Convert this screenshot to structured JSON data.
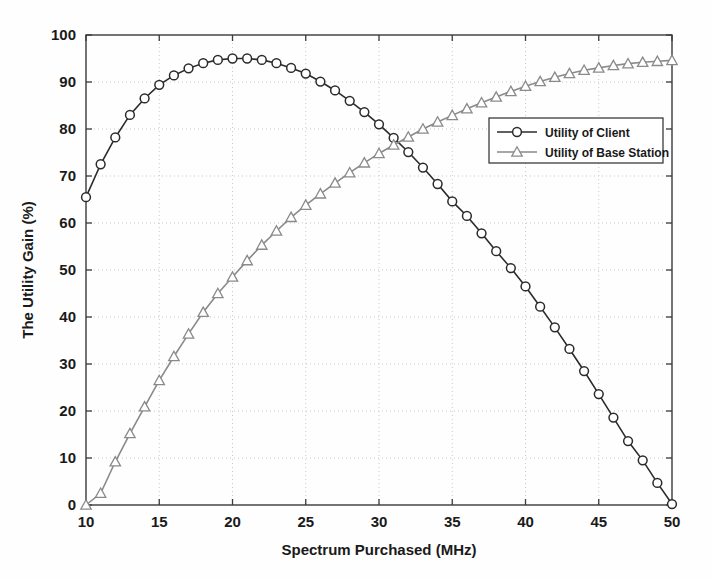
{
  "chart_data": {
    "type": "line",
    "title": "",
    "xlabel": "Spectrum Purchased (MHz)",
    "ylabel": "The Utility Gain (%)",
    "xlim": [
      10,
      50
    ],
    "ylim": [
      0,
      100
    ],
    "xticks": [
      10,
      15,
      20,
      25,
      30,
      35,
      40,
      45,
      50
    ],
    "yticks": [
      0,
      10,
      20,
      30,
      40,
      50,
      60,
      70,
      80,
      90,
      100
    ],
    "xtick_labels": [
      "10",
      "15",
      "20",
      "25",
      "30",
      "35",
      "40",
      "45",
      "50"
    ],
    "ytick_labels": [
      "0",
      "10",
      "20",
      "30",
      "40",
      "50",
      "60",
      "70",
      "80",
      "90",
      "100"
    ],
    "grid": true,
    "grid_style": "dotted",
    "legend_position": "center-right",
    "x": [
      10,
      11,
      12,
      13,
      14,
      15,
      16,
      17,
      18,
      19,
      20,
      21,
      22,
      23,
      24,
      25,
      26,
      27,
      28,
      29,
      30,
      31,
      32,
      33,
      34,
      35,
      36,
      37,
      38,
      39,
      40,
      41,
      42,
      43,
      44,
      45,
      46,
      47,
      48,
      49,
      50
    ],
    "series": [
      {
        "name": "Utility of Client",
        "marker": "circle",
        "color": "#2b2b2b",
        "values": [
          65.5,
          72.5,
          78.2,
          83.0,
          86.5,
          89.4,
          91.4,
          92.9,
          94.0,
          94.7,
          95.0,
          95.0,
          94.7,
          94.0,
          93.0,
          91.8,
          90.1,
          88.2,
          86.0,
          83.6,
          81.0,
          78.1,
          75.1,
          71.8,
          68.3,
          64.6,
          61.5,
          57.8,
          54.0,
          50.4,
          46.5,
          42.2,
          37.8,
          33.2,
          28.5,
          23.6,
          18.6,
          13.6,
          9.5,
          4.7,
          0.2
        ]
      },
      {
        "name": "Utility of Base Station",
        "marker": "triangle",
        "color": "#8a8a8a",
        "values": [
          0.0,
          2.5,
          9.2,
          15.2,
          20.9,
          26.5,
          31.6,
          36.4,
          41.0,
          45.0,
          48.5,
          52.0,
          55.3,
          58.3,
          61.2,
          63.8,
          66.2,
          68.5,
          70.7,
          72.8,
          74.8,
          76.6,
          78.3,
          80.0,
          81.5,
          82.9,
          84.3,
          85.6,
          86.8,
          88.0,
          89.1,
          90.1,
          91.0,
          91.8,
          92.5,
          93.0,
          93.5,
          93.9,
          94.2,
          94.4,
          94.6
        ]
      }
    ]
  },
  "legend": {
    "entries": [
      {
        "label": "Utility of Client"
      },
      {
        "label": "Utility of Base Station"
      }
    ]
  }
}
